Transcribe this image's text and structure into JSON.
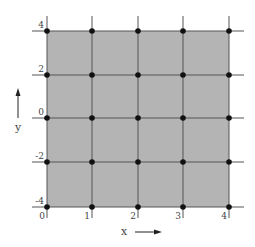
{
  "figure": {
    "type": "grid-diagram",
    "fill_color": "#b4b4b4",
    "line_color": "#555555",
    "dot_color": "#111111",
    "x_axis": {
      "label": "x",
      "ticks": [
        "0",
        "1",
        "2",
        "3",
        "4"
      ],
      "arrow": "right"
    },
    "y_axis": {
      "label": "y",
      "ticks": [
        "4",
        "2",
        "0",
        "-2",
        "-4"
      ],
      "arrow": "up"
    },
    "grid": {
      "columns": 4,
      "rows": 4,
      "node_count": 25
    }
  }
}
